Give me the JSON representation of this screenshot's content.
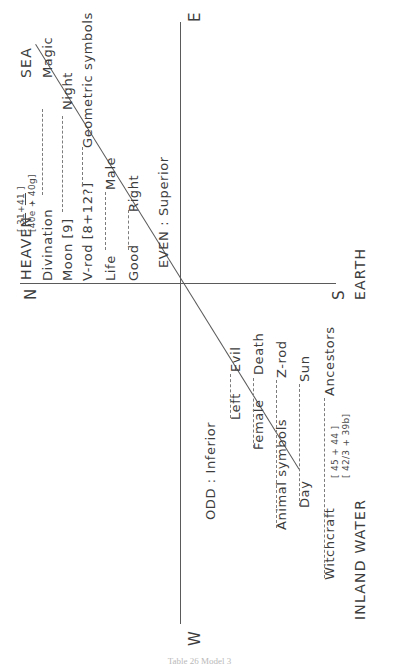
{
  "figure": {
    "caption": "Table 26  Model 3",
    "line_color": "#5a5a5a",
    "dash_color": "#7c7c7c",
    "text_color": "#3d3d3d"
  },
  "axes": {
    "compass": {
      "east": "E",
      "south": "S",
      "west": "W",
      "north": "N"
    },
    "poles": {
      "heaven": "HEAVEN",
      "sea": "SEA",
      "earth": "EARTH",
      "inland_water": "INLAND WATER"
    },
    "separator": "."
  },
  "moieties": {
    "upper": "EVEN : Superior",
    "lower": "ODD : Inferior"
  },
  "upper_pairs": [
    {
      "left": "Divination",
      "right": "Magic"
    },
    {
      "left": "Moon [9]",
      "right": "Night"
    },
    {
      "left": "V-rod [8+12?]",
      "right": "Geometric symbols"
    },
    {
      "left": "Life",
      "right": "Male"
    },
    {
      "left": "Good",
      "right": "Right"
    }
  ],
  "lower_pairs": [
    {
      "left": "Left",
      "right": "Evil"
    },
    {
      "left": "Female",
      "right": "Death"
    },
    {
      "left": "Animal symbols",
      "right": "Z-rod"
    },
    {
      "left": "Day",
      "right": "Sun"
    },
    {
      "left": "Witchcraft",
      "right": "Ancestors"
    }
  ],
  "brackets": {
    "upper": {
      "line1_num": "31",
      "line1_plus": "+",
      "line1_den": "41",
      "line2": "40e + 40g"
    },
    "lower": {
      "line1": "45 + 44",
      "line2": "42/3 + 39b"
    }
  }
}
